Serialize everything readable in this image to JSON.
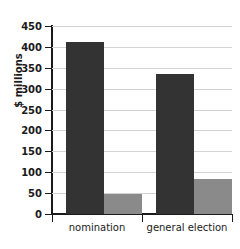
{
  "chart_data": {
    "type": "bar",
    "title": "",
    "subtitle": "",
    "xlabel": "",
    "ylabel": "$ millions",
    "categories": [
      "nomination",
      "general election"
    ],
    "series": [
      {
        "name": "dark",
        "color": "#333333",
        "values": [
          412,
          335
        ]
      },
      {
        "name": "light",
        "color": "#8a8a8a",
        "values": [
          49,
          83
        ]
      }
    ],
    "ylim": [
      0,
      450
    ],
    "ytick_step": 50,
    "ytick_labels": [
      "450",
      "400",
      "350",
      "300",
      "250",
      "200",
      "150",
      "100",
      "50",
      "0"
    ],
    "ytick_values": [
      450,
      400,
      350,
      300,
      250,
      200,
      150,
      100,
      50,
      0
    ],
    "grid": "horizontal",
    "legend": "none"
  },
  "axis": {
    "y_title": "$ millions",
    "tick_450": "450",
    "tick_400": "400",
    "tick_350": "350",
    "tick_300": "300",
    "tick_250": "250",
    "tick_200": "200",
    "tick_150": "150",
    "tick_100": "100",
    "tick_50": "50",
    "tick_0": "0"
  },
  "categories": {
    "cat_0": "nomination",
    "cat_1": "general election"
  }
}
